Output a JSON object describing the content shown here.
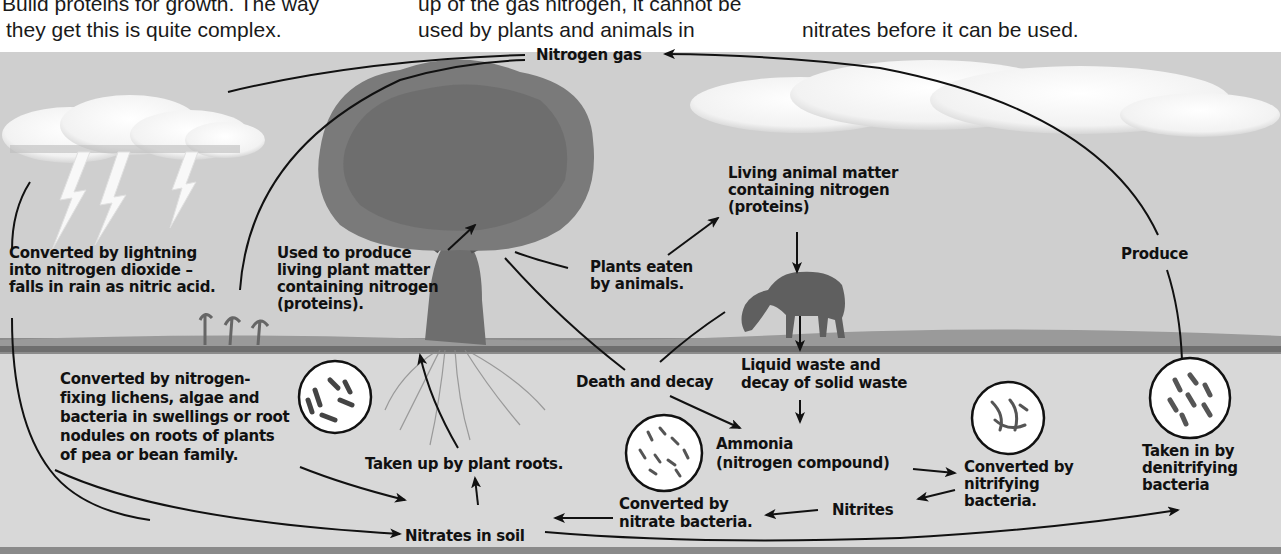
{
  "intro_text": {
    "col1": [
      "Build proteins for growth. The way",
      "they get this is quite complex."
    ],
    "col2": [
      "up of the gas nitrogen, it cannot be",
      "used by plants and animals in"
    ],
    "col3": [
      "nitrates before it can be used."
    ]
  },
  "diagram": {
    "title_node": "Nitrogen gas",
    "labels": {
      "lightning": [
        "Converted by lightning",
        "into nitrogen dioxide –",
        "falls in rain as nitric acid."
      ],
      "plant_matter": [
        "Used to produce",
        "living plant matter",
        "containing nitrogen",
        "(proteins)."
      ],
      "plants_eaten": [
        "Plants eaten",
        "by animals."
      ],
      "animal_matter": [
        "Living animal matter",
        "containing nitrogen",
        "(proteins)"
      ],
      "produce": "Produce",
      "fixing": [
        "Converted by nitrogen-",
        "fixing lichens, algae and",
        "bacteria in swellings or root",
        "nodules on roots of plants",
        "of pea or bean family."
      ],
      "death_decay": "Death and decay",
      "waste": [
        "Liquid waste and",
        "decay of solid waste"
      ],
      "roots": "Taken up by plant roots.",
      "ammonia": [
        "Ammonia",
        "(nitrogen compound)"
      ],
      "nitrifying": [
        "Converted by",
        "nitrifying",
        "bacteria."
      ],
      "denitrifying": [
        "Taken in by",
        "denitrifying",
        "bacteria"
      ],
      "nitrite_node": "Nitrites",
      "nitrate_bacteria": [
        "Converted by",
        "nitrate bacteria."
      ],
      "nitrates_soil": "Nitrates in soil"
    },
    "illustrations": [
      "storm-clouds",
      "lightning",
      "tree",
      "horse",
      "right-cloud",
      "bacteria-circles"
    ]
  }
}
